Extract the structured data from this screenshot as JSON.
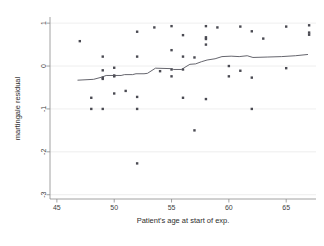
{
  "chart_data": {
    "type": "scatter",
    "title": "",
    "xlabel": "Patient's age at start of exp.",
    "ylabel": "martingale residual",
    "xlim": [
      44.4,
      67.6
    ],
    "ylim": [
      -3.1,
      1.12
    ],
    "xticks": [
      45,
      50,
      55,
      60,
      65
    ],
    "yticks": [
      1,
      0,
      -1,
      -2,
      -3
    ],
    "xticklabels": [
      "45",
      "50",
      "55",
      "60",
      "65"
    ],
    "yticklabels": [
      "1",
      "0",
      "-1",
      "-2",
      "-3"
    ],
    "grid": "horizontal-light",
    "legend": "none",
    "marker_style": "small filled square",
    "marker_color": "#4a4a52",
    "line_color": "#54545c",
    "background_color": "#ffffff",
    "axis_color": "#8a8a8a",
    "grid_color": "#e2e2e2",
    "points": [
      {
        "x": 47.0,
        "y": 0.58
      },
      {
        "x": 48.0,
        "y": -0.74
      },
      {
        "x": 48.0,
        "y": -1.0
      },
      {
        "x": 49.0,
        "y": 0.22
      },
      {
        "x": 49.0,
        "y": -0.1
      },
      {
        "x": 49.0,
        "y": -0.27
      },
      {
        "x": 49.0,
        "y": -0.3
      },
      {
        "x": 49.0,
        "y": -1.0
      },
      {
        "x": 50.0,
        "y": -0.04
      },
      {
        "x": 50.0,
        "y": -0.22
      },
      {
        "x": 50.0,
        "y": -0.24
      },
      {
        "x": 50.0,
        "y": -0.64
      },
      {
        "x": 51.0,
        "y": -0.58
      },
      {
        "x": 52.0,
        "y": 0.8
      },
      {
        "x": 52.0,
        "y": 0.22
      },
      {
        "x": 52.0,
        "y": -0.72
      },
      {
        "x": 52.0,
        "y": -1.0
      },
      {
        "x": 52.0,
        "y": -2.27
      },
      {
        "x": 53.5,
        "y": 0.9
      },
      {
        "x": 54.0,
        "y": -0.12
      },
      {
        "x": 55.0,
        "y": 0.93
      },
      {
        "x": 55.0,
        "y": 0.37
      },
      {
        "x": 55.0,
        "y": -0.08
      },
      {
        "x": 55.0,
        "y": -0.24
      },
      {
        "x": 56.0,
        "y": 0.72
      },
      {
        "x": 56.0,
        "y": 0.22
      },
      {
        "x": 56.0,
        "y": -0.08
      },
      {
        "x": 56.0,
        "y": -0.74
      },
      {
        "x": 57.0,
        "y": 0.2
      },
      {
        "x": 57.0,
        "y": -1.5
      },
      {
        "x": 58.0,
        "y": 0.93
      },
      {
        "x": 58.0,
        "y": 0.67
      },
      {
        "x": 58.0,
        "y": 0.63
      },
      {
        "x": 58.0,
        "y": 0.5
      },
      {
        "x": 58.0,
        "y": -0.77
      },
      {
        "x": 59.0,
        "y": 0.9
      },
      {
        "x": 60.0,
        "y": 0.0
      },
      {
        "x": 60.0,
        "y": -0.24
      },
      {
        "x": 61.0,
        "y": 0.92
      },
      {
        "x": 61.0,
        "y": -0.11
      },
      {
        "x": 62.0,
        "y": 0.81
      },
      {
        "x": 62.0,
        "y": -0.27
      },
      {
        "x": 62.0,
        "y": -1.0
      },
      {
        "x": 63.0,
        "y": 0.64
      },
      {
        "x": 65.0,
        "y": 0.92
      },
      {
        "x": 65.0,
        "y": -0.05
      },
      {
        "x": 67.0,
        "y": 0.95
      },
      {
        "x": 67.0,
        "y": 0.78
      },
      {
        "x": 67.0,
        "y": 0.73
      }
    ],
    "smoother": [
      {
        "x": 46.8,
        "y": -0.33
      },
      {
        "x": 48.2,
        "y": -0.31
      },
      {
        "x": 48.9,
        "y": -0.26
      },
      {
        "x": 49.3,
        "y": -0.22
      },
      {
        "x": 50.6,
        "y": -0.22
      },
      {
        "x": 50.9,
        "y": -0.2
      },
      {
        "x": 51.6,
        "y": -0.2
      },
      {
        "x": 51.9,
        "y": -0.18
      },
      {
        "x": 52.6,
        "y": -0.18
      },
      {
        "x": 52.9,
        "y": -0.17
      },
      {
        "x": 53.6,
        "y": -0.05
      },
      {
        "x": 54.9,
        "y": -0.06
      },
      {
        "x": 55.2,
        "y": -0.08
      },
      {
        "x": 55.9,
        "y": -0.08
      },
      {
        "x": 56.1,
        "y": -0.04
      },
      {
        "x": 56.6,
        "y": 0.04
      },
      {
        "x": 57.1,
        "y": 0.05
      },
      {
        "x": 57.6,
        "y": 0.1
      },
      {
        "x": 58.1,
        "y": 0.14
      },
      {
        "x": 58.8,
        "y": 0.17
      },
      {
        "x": 59.4,
        "y": 0.22
      },
      {
        "x": 60.2,
        "y": 0.23
      },
      {
        "x": 60.9,
        "y": 0.22
      },
      {
        "x": 61.6,
        "y": 0.24
      },
      {
        "x": 62.1,
        "y": 0.2
      },
      {
        "x": 63.4,
        "y": 0.21
      },
      {
        "x": 64.6,
        "y": 0.22
      },
      {
        "x": 65.8,
        "y": 0.24
      },
      {
        "x": 66.9,
        "y": 0.27
      }
    ]
  }
}
